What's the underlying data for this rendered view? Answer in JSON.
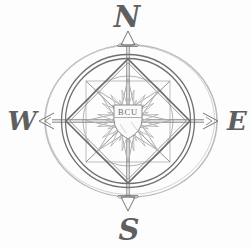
{
  "compass": {
    "labels": {
      "north": "N",
      "east": "E",
      "south": "S",
      "west": "W"
    },
    "shield_text": "BCU",
    "colors": {
      "background": "#fdfdfd",
      "ink_dark": "#6e6e6e",
      "ink_mid": "#8d8d8d",
      "ink_light": "#b6b6b6",
      "letters": "#5f5f5f"
    }
  }
}
